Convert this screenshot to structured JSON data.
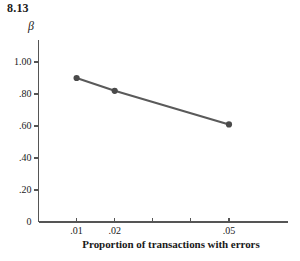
{
  "figure": {
    "number": "8.13"
  },
  "chart_data": {
    "type": "line",
    "title": "8.13",
    "xlabel": "Proportion of transactions with errors",
    "ylabel": "β",
    "x": [
      0.01,
      0.02,
      0.05
    ],
    "values": [
      0.9,
      0.82,
      0.61
    ],
    "categories": [
      ".01",
      ".02",
      ".05"
    ],
    "series": [
      {
        "name": "β",
        "values": [
          0.9,
          0.82,
          0.61
        ]
      }
    ],
    "xlim": [
      0.0,
      0.0655
    ],
    "ylim": [
      0,
      1.1375
    ],
    "grid": false,
    "legend": "none",
    "line_color": "#5a5a5a",
    "marker_color": "#4a4a4a",
    "axis_color": "#555555",
    "y_ticks": [
      {
        "value": 1.0,
        "label": "1.00"
      },
      {
        "value": 0.8,
        "label": ".80"
      },
      {
        "value": 0.6,
        "label": ".60"
      },
      {
        "value": 0.4,
        "label": ".40"
      },
      {
        "value": 0.2,
        "label": ".20"
      },
      {
        "value": 0.0,
        "label": "0"
      }
    ],
    "x_ticks": [
      {
        "value": 0.01,
        "label": ".01"
      },
      {
        "value": 0.02,
        "label": ".02"
      },
      {
        "value": 0.03,
        "label": ""
      },
      {
        "value": 0.04,
        "label": ""
      },
      {
        "value": 0.05,
        "label": ".05"
      }
    ]
  }
}
